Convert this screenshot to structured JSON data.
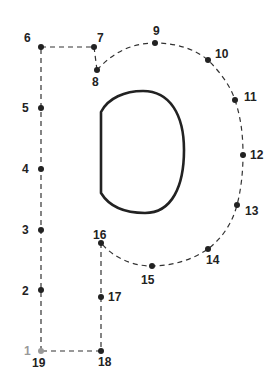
{
  "colors": {
    "dot": "#222222",
    "first_dot": "#999999",
    "line": "#333333",
    "shape": "#222222"
  },
  "points": [
    {
      "n": "1",
      "x": 41,
      "y": 351,
      "lx": 24,
      "ly": 355,
      "first": true
    },
    {
      "n": "2",
      "x": 41,
      "y": 290,
      "lx": 22,
      "ly": 295
    },
    {
      "n": "3",
      "x": 41,
      "y": 230,
      "lx": 22,
      "ly": 234
    },
    {
      "n": "4",
      "x": 41,
      "y": 169,
      "lx": 22,
      "ly": 173
    },
    {
      "n": "5",
      "x": 41,
      "y": 108,
      "lx": 22,
      "ly": 112
    },
    {
      "n": "6",
      "x": 41,
      "y": 47,
      "lx": 24,
      "ly": 42
    },
    {
      "n": "7",
      "x": 94,
      "y": 47,
      "lx": 97,
      "ly": 42
    },
    {
      "n": "8",
      "x": 97,
      "y": 70,
      "lx": 92,
      "ly": 86
    },
    {
      "n": "9",
      "x": 155,
      "y": 43,
      "lx": 153,
      "ly": 35
    },
    {
      "n": "10",
      "x": 208,
      "y": 60,
      "lx": 215,
      "ly": 58
    },
    {
      "n": "11",
      "x": 235,
      "y": 100,
      "lx": 244,
      "ly": 101
    },
    {
      "n": "12",
      "x": 243,
      "y": 155,
      "lx": 250,
      "ly": 159
    },
    {
      "n": "13",
      "x": 237,
      "y": 205,
      "lx": 245,
      "ly": 215
    },
    {
      "n": "14",
      "x": 208,
      "y": 249,
      "lx": 206,
      "ly": 264
    },
    {
      "n": "15",
      "x": 152,
      "y": 266,
      "lx": 141,
      "ly": 284
    },
    {
      "n": "16",
      "x": 101,
      "y": 243,
      "lx": 93,
      "ly": 239
    },
    {
      "n": "17",
      "x": 101,
      "y": 297,
      "lx": 108,
      "ly": 301
    },
    {
      "n": "18",
      "x": 101,
      "y": 351,
      "lx": 98,
      "ly": 366
    },
    {
      "n": "19",
      "x": 41,
      "y": 351,
      "lx": 32,
      "ly": 367
    }
  ]
}
